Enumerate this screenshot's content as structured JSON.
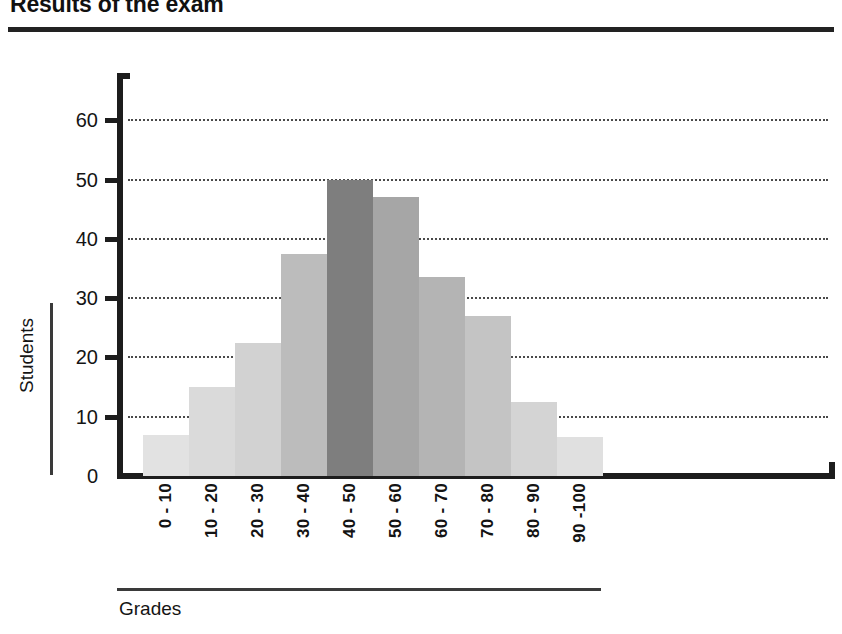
{
  "document": {
    "title": "Results of the exam"
  },
  "chart_data": {
    "type": "bar",
    "title": "Results of the exam",
    "xlabel": "Grades",
    "ylabel": "Students",
    "categories": [
      "0 - 10",
      "10 - 20",
      "20 - 30",
      "30 - 40",
      "40 - 50",
      "50 - 60",
      "60 - 70",
      "70 - 80",
      "80 - 90",
      "90 -100"
    ],
    "values": [
      7,
      15,
      22.5,
      37.5,
      50,
      47,
      33.5,
      27,
      12.5,
      6.5
    ],
    "ylim": [
      0,
      65
    ],
    "yticks": [
      0,
      10,
      20,
      30,
      40,
      50,
      60
    ],
    "ytick_labels": [
      "0",
      "10",
      "20",
      "30",
      "40",
      "50",
      "60"
    ],
    "grid": "horizontal-dotted",
    "legend": "none",
    "bar_colors": [
      "#e2e2e2",
      "#dadada",
      "#d2d2d2",
      "#bcbcbc",
      "#7e7e7e",
      "#a6a6a6",
      "#b4b4b4",
      "#c4c4c4",
      "#d4d4d4",
      "#e0e0e0"
    ],
    "axis_color": "#1d1d1d",
    "grid_color": "#4a4a4a"
  }
}
